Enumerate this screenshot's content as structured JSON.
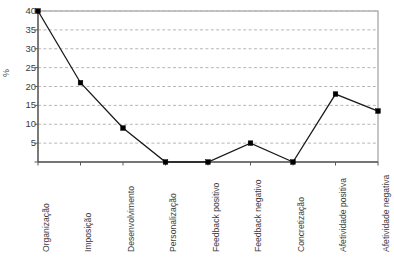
{
  "chart_data": {
    "type": "line",
    "title": "",
    "subtitle": "",
    "xlabel": "",
    "ylabel": "%",
    "categories": [
      "Organização",
      "Imposição",
      "Desenvolvimento",
      "Personalização",
      "Feedback positivo",
      "Feedback negativo",
      "Concretização",
      "Afetividade positiva",
      "Afetividade negativa"
    ],
    "values": [
      40,
      21,
      9,
      0,
      0,
      5,
      0,
      18,
      13.5
    ],
    "ylim": [
      0,
      40
    ],
    "yticks": [
      0,
      5,
      10,
      15,
      20,
      25,
      30,
      35,
      40
    ],
    "ytick_labels": [
      "",
      "5",
      "10",
      "15",
      "20",
      "25",
      "30",
      "35",
      "40"
    ],
    "grid": true,
    "grid_style": "dashed",
    "grid_axis": "y",
    "legend": false,
    "legend_position": "none",
    "marker": "square",
    "marker_color": "#000000",
    "line_color": "#1a1a1a",
    "series": [
      {
        "name": "",
        "values": [
          40,
          21,
          9,
          0,
          0,
          5,
          0,
          18,
          13.5
        ]
      }
    ]
  },
  "colors": {
    "background": "#ffffff",
    "line": "#1a1a1a",
    "marker": "#000000",
    "grid": "#b6b6b6",
    "frame": "#8c8c8c",
    "axis": "#5a5a5a",
    "text": "#3d3d3d"
  },
  "plot_area": {
    "left": 38,
    "top": 11,
    "right": 378,
    "bottom": 162
  }
}
